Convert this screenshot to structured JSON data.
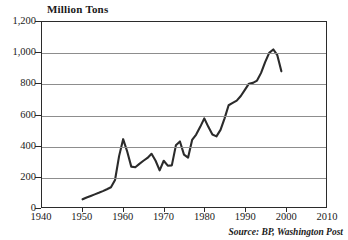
{
  "chart_data": {
    "type": "line",
    "title": "Million Tons",
    "xlabel": "",
    "ylabel": "Million Tons",
    "xlim": [
      1940,
      2010
    ],
    "ylim": [
      0,
      1200
    ],
    "grid": true,
    "legend": null,
    "source_note": "Source: BP, Washington Post",
    "xticks": [
      "1940",
      "1950",
      "1960",
      "1970",
      "1980",
      "1990",
      "2000",
      "2010"
    ],
    "xtick_values": [
      1940,
      1950,
      1960,
      1970,
      1980,
      1990,
      2000,
      2010
    ],
    "yticks": [
      "0",
      "200",
      "400",
      "600",
      "800",
      "1,000",
      "1,200"
    ],
    "ytick_values": [
      0,
      200,
      400,
      600,
      800,
      1000,
      1200
    ],
    "series": [
      {
        "name": "Million Tons",
        "color": "#2b2b2b",
        "x": [
          1950,
          1951,
          1952,
          1953,
          1954,
          1955,
          1956,
          1957,
          1958,
          1959,
          1960,
          1961,
          1962,
          1963,
          1964,
          1965,
          1966,
          1967,
          1968,
          1969,
          1970,
          1971,
          1972,
          1973,
          1974,
          1975,
          1976,
          1977,
          1978,
          1979,
          1980,
          1981,
          1982,
          1983,
          1984,
          1985,
          1986,
          1987,
          1988,
          1989,
          1990,
          1991,
          1992,
          1993,
          1994,
          1995,
          1996,
          1997,
          1998,
          1999
        ],
        "values": [
          50,
          62,
          72,
          82,
          92,
          103,
          115,
          128,
          175,
          330,
          440,
          360,
          262,
          258,
          280,
          300,
          318,
          345,
          300,
          238,
          300,
          268,
          270,
          400,
          425,
          340,
          320,
          435,
          470,
          520,
          575,
          520,
          470,
          458,
          500,
          575,
          660,
          675,
          690,
          720,
          760,
          800,
          805,
          820,
          870,
          940,
          1000,
          1022,
          985,
          880
        ]
      }
    ]
  }
}
